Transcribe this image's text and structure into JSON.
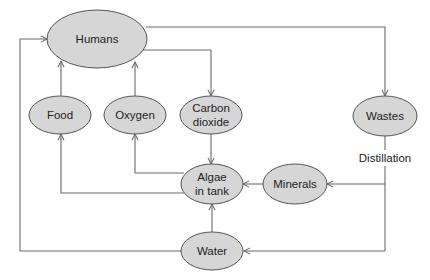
{
  "diagram": {
    "type": "flow",
    "nodes": {
      "humans": {
        "label": "Humans"
      },
      "food": {
        "label": "Food"
      },
      "oxygen": {
        "label": "Oxygen"
      },
      "carbon_dioxide": {
        "line1": "Carbon",
        "line2": "dioxide"
      },
      "wastes": {
        "label": "Wastes"
      },
      "algae": {
        "line1": "Algae",
        "line2": "in tank"
      },
      "minerals": {
        "label": "Minerals"
      },
      "water": {
        "label": "Water"
      }
    },
    "edge_labels": {
      "distillation": "Distillation"
    },
    "edges": [
      {
        "from": "Humans",
        "to": "Carbon dioxide"
      },
      {
        "from": "Humans",
        "to": "Wastes"
      },
      {
        "from": "Carbon dioxide",
        "to": "Algae in tank"
      },
      {
        "from": "Algae in tank",
        "to": "Food"
      },
      {
        "from": "Algae in tank",
        "to": "Oxygen"
      },
      {
        "from": "Food",
        "to": "Humans"
      },
      {
        "from": "Oxygen",
        "to": "Humans"
      },
      {
        "from": "Wastes",
        "to": "Minerals",
        "label": "Distillation"
      },
      {
        "from": "Wastes",
        "to": "Water",
        "label": "Distillation"
      },
      {
        "from": "Minerals",
        "to": "Algae in tank"
      },
      {
        "from": "Water",
        "to": "Algae in tank"
      },
      {
        "from": "Water",
        "to": "Humans"
      }
    ],
    "colors": {
      "node_fill": "#d6d6d6",
      "node_stroke": "#555555",
      "edge": "#6a6a6a",
      "text": "#222222"
    }
  }
}
